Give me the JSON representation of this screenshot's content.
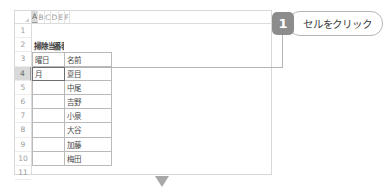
{
  "spreadsheet": {
    "column_headers": [
      "A",
      "B",
      "C",
      "D",
      "E",
      "F"
    ],
    "active_column": "A",
    "row_headers": [
      "1",
      "2",
      "3",
      "4",
      "5",
      "6",
      "7",
      "8",
      "9",
      "10",
      "11"
    ],
    "active_row": "4",
    "title_cell": "掃除当番表",
    "table_headers": {
      "day": "曜日",
      "name": "名前"
    },
    "selected_cell": {
      "reference": "A4",
      "value": "月"
    },
    "names": [
      "夏目",
      "中尾",
      "吉野",
      "小泉",
      "大谷",
      "加藤",
      "梅田"
    ],
    "empty": ""
  },
  "callout": {
    "step_number": "1",
    "text": "セルをクリック"
  },
  "colors": {
    "badge": "#8c8c8c",
    "arrow": "#a8a8a8",
    "selection_border": "#6e6e6e",
    "connector": "#b4b4b4",
    "header_active": "#d9d9d9"
  }
}
